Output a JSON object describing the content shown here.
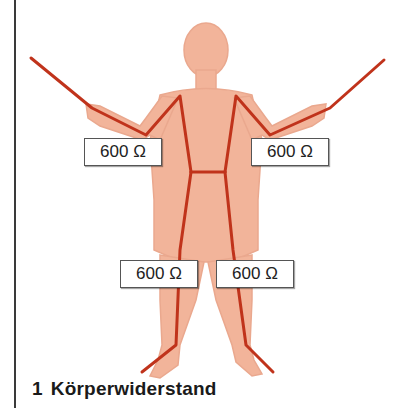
{
  "figure": {
    "colors": {
      "skin": "#f2b49a",
      "skin_outline": "#e9a489",
      "current_path": "#c0331b",
      "label_border": "#555555",
      "rule": "#3a3a3a"
    },
    "labels": [
      {
        "id": "left-arm",
        "text": "600 Ω"
      },
      {
        "id": "right-arm",
        "text": "600 Ω"
      },
      {
        "id": "left-leg",
        "text": "600 Ω"
      },
      {
        "id": "right-leg",
        "text": "600 Ω"
      }
    ]
  },
  "caption": {
    "number": "1",
    "title": "Körperwiderstand"
  }
}
